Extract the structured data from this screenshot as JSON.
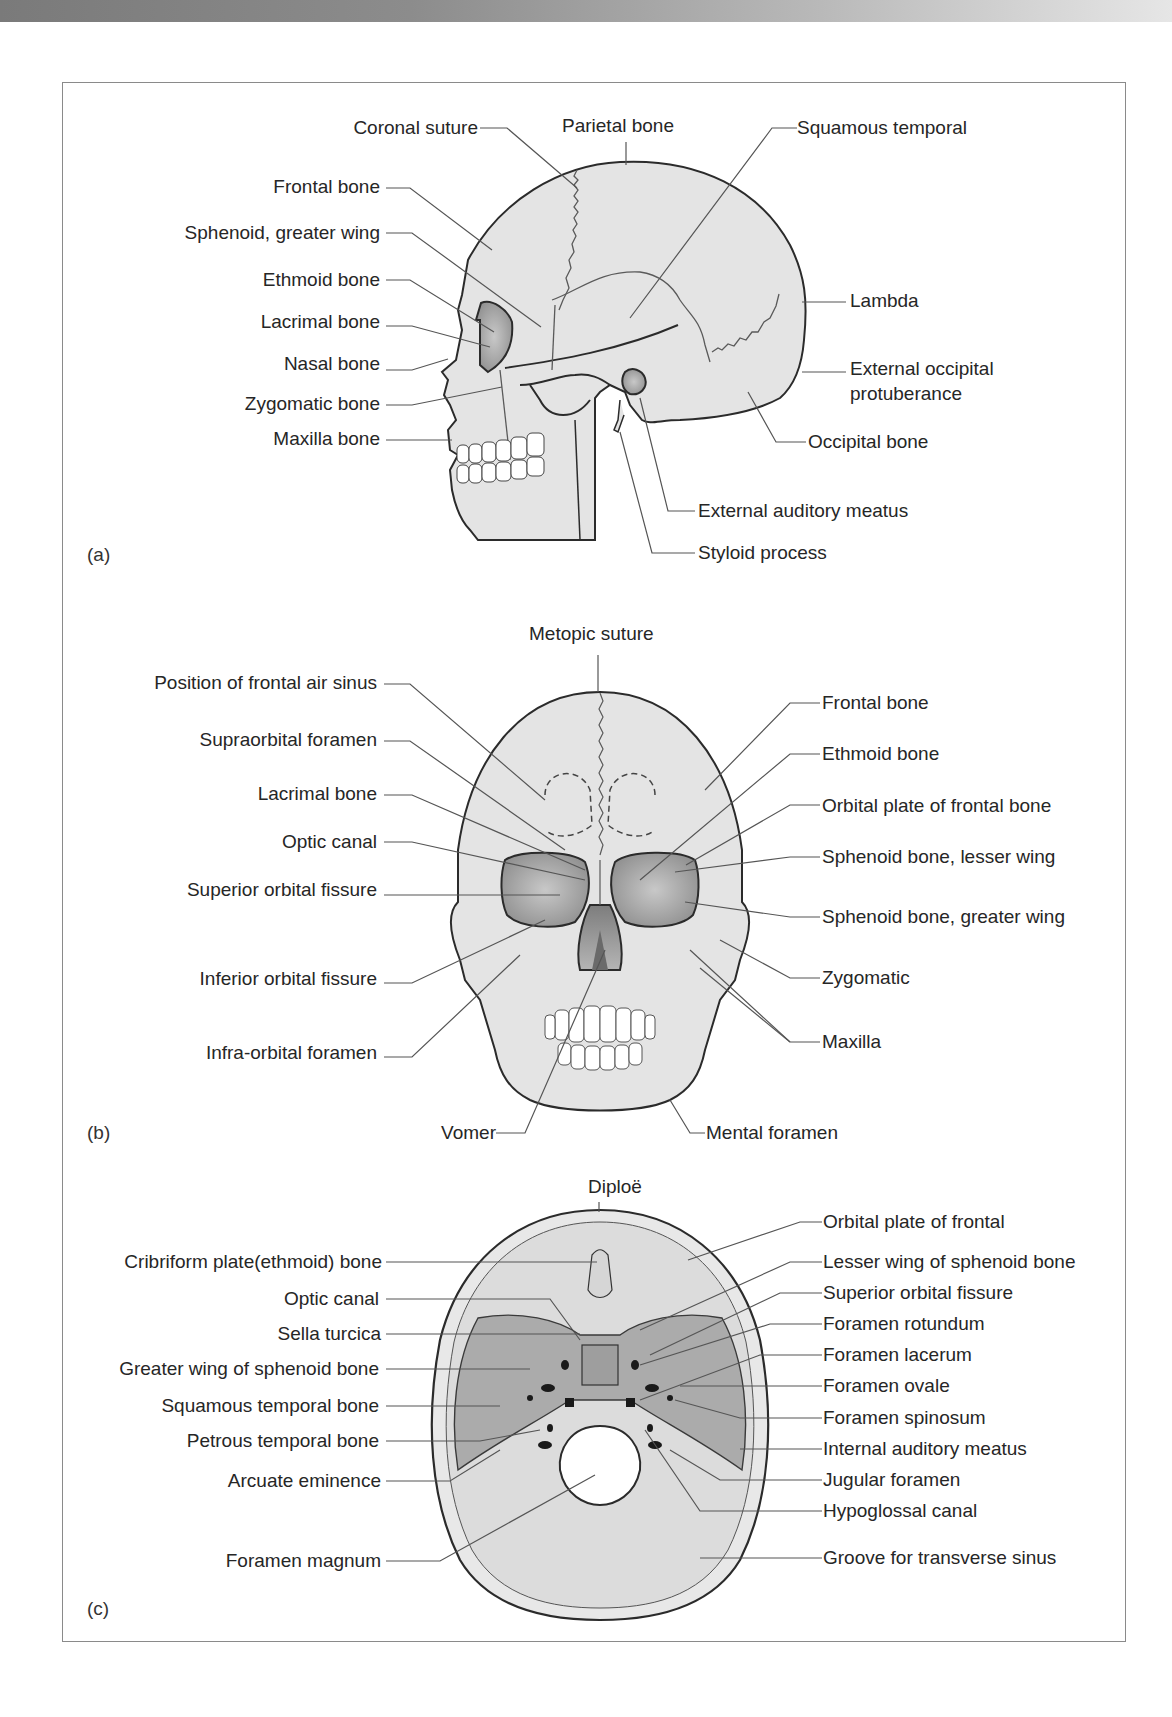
{
  "figure": {
    "panels": [
      {
        "id": "a",
        "label": "(a)",
        "view": "lateral skull",
        "labels_left": [
          {
            "text": "Coronal suture"
          },
          {
            "text": "Frontal bone"
          },
          {
            "text": "Sphenoid, greater wing"
          },
          {
            "text": "Ethmoid bone"
          },
          {
            "text": "Lacrimal bone"
          },
          {
            "text": "Nasal bone"
          },
          {
            "text": "Zygomatic bone"
          },
          {
            "text": "Maxilla bone"
          }
        ],
        "labels_top": [
          {
            "text": "Parietal bone"
          }
        ],
        "labels_right": [
          {
            "text": "Squamous temporal"
          },
          {
            "text": "Lambda"
          },
          {
            "text": "External occipital"
          },
          {
            "text": "protuberance"
          },
          {
            "text": "Occipital bone"
          },
          {
            "text": "External auditory meatus"
          },
          {
            "text": "Styloid process"
          }
        ]
      },
      {
        "id": "b",
        "label": "(b)",
        "view": "anterior skull",
        "labels_top": [
          {
            "text": "Metopic suture"
          }
        ],
        "labels_left": [
          {
            "text": "Position of frontal air sinus"
          },
          {
            "text": "Supraorbital foramen"
          },
          {
            "text": "Lacrimal bone"
          },
          {
            "text": "Optic canal"
          },
          {
            "text": "Superior orbital fissure"
          },
          {
            "text": "Inferior orbital fissure"
          },
          {
            "text": "Infra-orbital foramen"
          }
        ],
        "labels_right": [
          {
            "text": "Frontal bone"
          },
          {
            "text": "Ethmoid bone"
          },
          {
            "text": "Orbital plate of frontal bone"
          },
          {
            "text": "Sphenoid bone, lesser wing"
          },
          {
            "text": "Sphenoid bone, greater wing"
          },
          {
            "text": "Zygomatic"
          },
          {
            "text": "Maxilla"
          }
        ],
        "labels_bottom": [
          {
            "text": "Vomer"
          },
          {
            "text": "Mental foramen"
          }
        ]
      },
      {
        "id": "c",
        "label": "(c)",
        "view": "cranial base (superior view)",
        "labels_top": [
          {
            "text": "Diploë"
          }
        ],
        "labels_left": [
          {
            "text": "Cribriform plate(ethmoid) bone"
          },
          {
            "text": "Optic canal"
          },
          {
            "text": "Sella turcica"
          },
          {
            "text": "Greater wing of sphenoid bone"
          },
          {
            "text": "Squamous temporal bone"
          },
          {
            "text": "Petrous temporal bone"
          },
          {
            "text": "Arcuate eminence"
          },
          {
            "text": "Foramen magnum"
          }
        ],
        "labels_right": [
          {
            "text": "Orbital plate of frontal"
          },
          {
            "text": "Lesser wing of sphenoid bone"
          },
          {
            "text": "Superior orbital fissure"
          },
          {
            "text": "Foramen rotundum"
          },
          {
            "text": "Foramen lacerum"
          },
          {
            "text": "Foramen ovale"
          },
          {
            "text": "Foramen spinosum"
          },
          {
            "text": "Internal auditory meatus"
          },
          {
            "text": "Jugular foramen"
          },
          {
            "text": "Hypoglossal canal"
          },
          {
            "text": "Groove for transverse sinus"
          }
        ]
      }
    ],
    "colors": {
      "bone_fill": "#e4e4e4",
      "dark_fill": "#9a9a9a",
      "mid_fill": "#b3b3b3",
      "outline": "#2b2b2b",
      "leader": "#555555",
      "frame": "#8a8a8a"
    }
  }
}
